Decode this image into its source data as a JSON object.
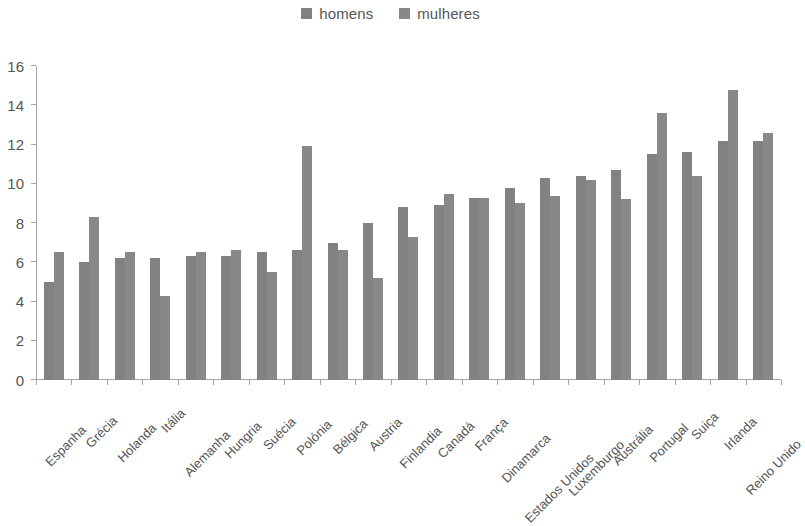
{
  "legend": {
    "position": "top-center",
    "entries": [
      {
        "label": "homens",
        "color": "#828282",
        "swatch_icon": "legend-square-icon"
      },
      {
        "label": "mulheres",
        "color": "#888888",
        "swatch_icon": "legend-square-icon"
      }
    ]
  },
  "axis": {
    "y_ticks": [
      "0",
      "2",
      "4",
      "6",
      "8",
      "10",
      "12",
      "14",
      "16"
    ],
    "y_min": 0,
    "y_max": 16,
    "y_step": 2
  },
  "chart_data": {
    "type": "bar",
    "title": "",
    "subtitle": "",
    "xlabel": "",
    "ylabel": "",
    "ylim": [
      0,
      16
    ],
    "ytick_step": 2,
    "grid": false,
    "legend_position": "top-center",
    "orientation": "vertical-grouped",
    "bar_color": "#848484",
    "categories": [
      "Espanha",
      "Grécia",
      "Holanda",
      "Itália",
      "Alemanha",
      "Hungria",
      "Suécia",
      "Polónia",
      "Bélgica",
      "Austria",
      "Finlandia",
      "Canadá",
      "França",
      "Dinamarca",
      "Estados Unidos",
      "Luxemburgo",
      "Austrália",
      "Portugal",
      "Suiça",
      "Irlanda",
      "Reino Unido"
    ],
    "series": [
      {
        "name": "homens",
        "color": "#828282",
        "values": [
          5.0,
          6.0,
          6.2,
          6.2,
          6.3,
          6.3,
          6.5,
          6.6,
          7.0,
          8.0,
          8.8,
          8.9,
          9.3,
          9.8,
          10.3,
          10.4,
          10.7,
          11.5,
          11.6,
          12.2,
          12.2
        ]
      },
      {
        "name": "mulheres",
        "color": "#888888",
        "values": [
          6.5,
          8.3,
          6.5,
          4.3,
          6.5,
          6.6,
          5.5,
          11.9,
          6.6,
          5.2,
          7.3,
          9.5,
          9.3,
          9.0,
          9.4,
          10.2,
          9.2,
          13.6,
          10.4,
          14.8,
          12.6
        ]
      }
    ]
  }
}
